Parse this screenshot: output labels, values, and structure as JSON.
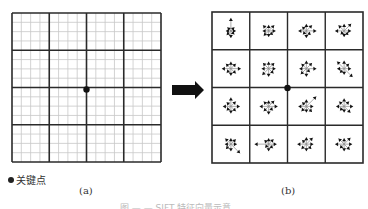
{
  "figure": {
    "panel_a": {
      "label": "(a)",
      "grid": {
        "x": 12,
        "y": 13,
        "size": 149,
        "major_divisions": 4,
        "minor_per_major": 4
      },
      "keypoint": {
        "x": 86.5,
        "y": 89.5
      },
      "legend_symbol": "●",
      "legend_text": "关键点"
    },
    "panel_b": {
      "label": "(b)",
      "grid": {
        "x": 212,
        "y": 12,
        "size": 151,
        "divisions": 4
      },
      "keypoint": {
        "x": 287.5,
        "y": 88
      },
      "descriptor_cells": [
        [
          [
            5,
            5,
            13,
            5,
            5,
            6,
            7,
            5
          ],
          [
            7,
            8,
            6,
            8,
            6,
            7,
            6,
            6
          ],
          [
            10,
            8,
            7,
            6,
            8,
            5,
            7,
            6
          ],
          [
            7,
            10,
            7,
            8,
            9,
            5,
            6,
            6
          ]
        ],
        [
          [
            10,
            7,
            7,
            7,
            9,
            6,
            7,
            7
          ],
          [
            7,
            8,
            7,
            8,
            7,
            9,
            8,
            7
          ],
          [
            10,
            8,
            8,
            7,
            7,
            8,
            8,
            5
          ],
          [
            7,
            7,
            8,
            10,
            7,
            6,
            6,
            12
          ]
        ],
        [
          [
            9,
            7,
            9,
            6,
            8,
            6,
            7,
            7
          ],
          [
            9,
            8,
            6,
            7,
            9,
            7,
            8,
            6
          ],
          [
            7,
            14,
            7,
            6,
            8,
            7,
            6,
            8
          ],
          [
            9,
            7,
            8,
            7,
            8,
            6,
            6,
            9
          ]
        ],
        [
          [
            6,
            7,
            6,
            8,
            6,
            7,
            7,
            13
          ],
          [
            8,
            7,
            6,
            6,
            14,
            5,
            7,
            6
          ],
          [
            7,
            9,
            7,
            6,
            9,
            7,
            7,
            7
          ],
          [
            8,
            9,
            6,
            8,
            9,
            6,
            7,
            8
          ]
        ]
      ]
    },
    "arrow": {
      "from_x": 172,
      "to_x": 204,
      "y": 90
    },
    "caption": "图 — — SIFT 特征向量示意"
  },
  "colors": {
    "major_line": "#2a2a2a",
    "minor_line": "#c8c8c8",
    "ink": "#111111",
    "thin_ray": "#888888"
  }
}
